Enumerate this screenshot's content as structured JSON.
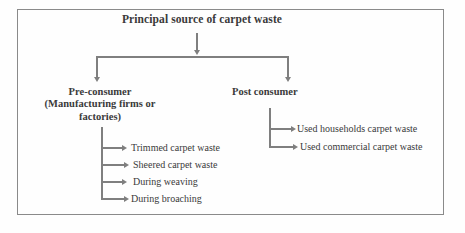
{
  "diagram": {
    "title": "Principal source of carpet waste",
    "branches": [
      {
        "label": "Pre-consumer\n(Manufacturing firms or\nfactories)",
        "items": [
          "Trimmed carpet waste",
          "Sheered carpet waste",
          "During weaving",
          "During broaching"
        ]
      },
      {
        "label": "Post consumer",
        "items": [
          "Used households carpet waste",
          "Used commercial carpet waste"
        ]
      }
    ]
  },
  "style": {
    "line_color": "#7f7f7f",
    "text_color": "#3a3a3a",
    "border_color": "#8a8a8a",
    "background": "#ffffff"
  }
}
